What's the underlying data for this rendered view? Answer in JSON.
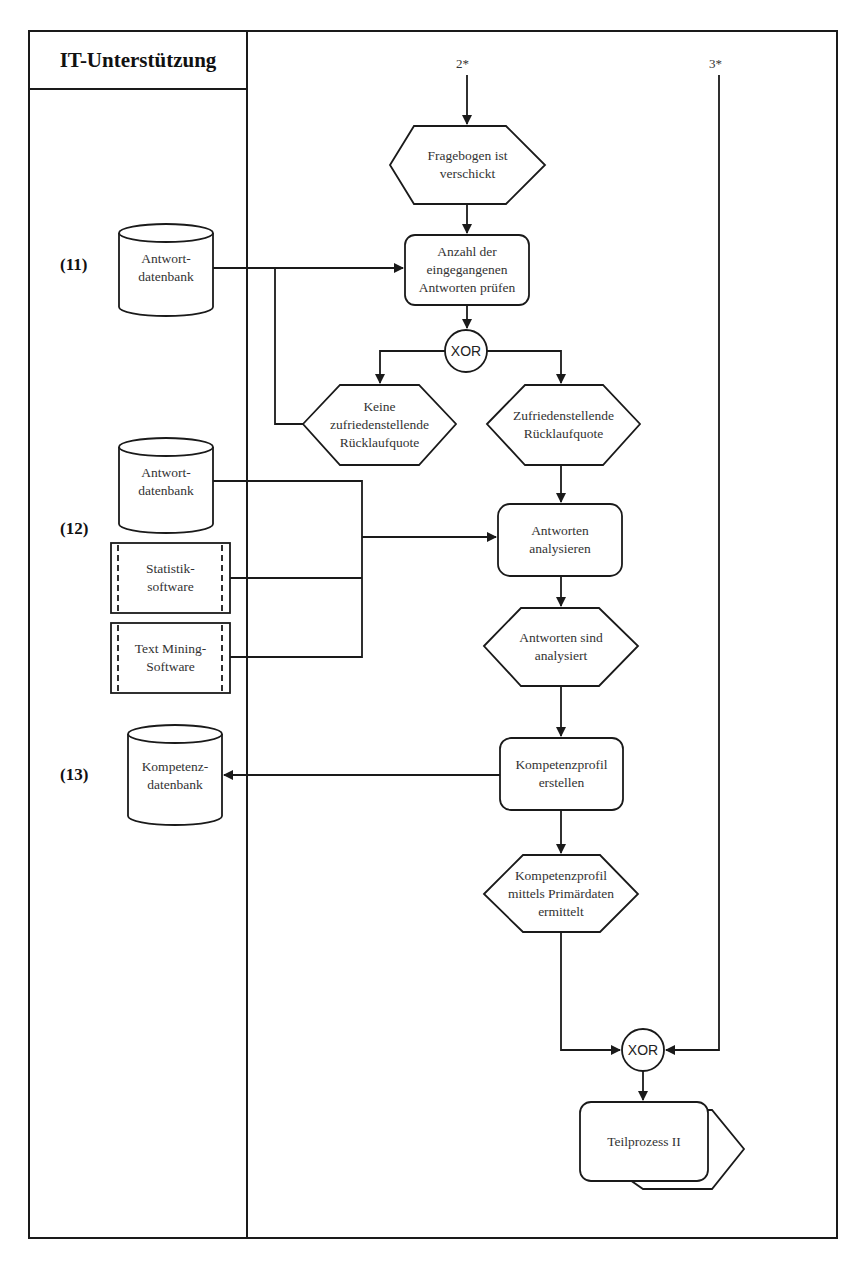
{
  "lane": {
    "title": "IT-Unterstützung"
  },
  "connectors": {
    "top_left": "2*",
    "top_right": "3*"
  },
  "groups": [
    {
      "id": "11",
      "label": "(11)"
    },
    {
      "id": "12",
      "label": "(12)"
    },
    {
      "id": "13",
      "label": "(13)"
    }
  ],
  "systems": {
    "db_11": {
      "line1": "Antwort-",
      "line2": "datenbank"
    },
    "db_12": {
      "line1": "Antwort-",
      "line2": "datenbank"
    },
    "stat_sw": {
      "line1": "Statistik-",
      "line2": "software"
    },
    "tm_sw": {
      "line1": "Text Mining-",
      "line2": "Software"
    },
    "db_13": {
      "line1": "Kompetenz-",
      "line2": "datenbank"
    }
  },
  "events": {
    "e1": {
      "lines": [
        "Fragebogen ist",
        "verschickt"
      ]
    },
    "e2": {
      "lines": [
        "Keine",
        "zufriedenstellende",
        "Rücklaufquote"
      ]
    },
    "e3": {
      "lines": [
        "Zufriedenstellende",
        "Rücklaufquote"
      ]
    },
    "e4": {
      "lines": [
        "Antworten sind",
        "analysiert"
      ]
    },
    "e5": {
      "lines": [
        "Kompetenzprofil",
        "mittels Primärdaten",
        "ermittelt"
      ]
    }
  },
  "functions": {
    "f1": {
      "lines": [
        "Anzahl der",
        "eingegangenen",
        "Antworten prüfen"
      ]
    },
    "f2": {
      "lines": [
        "Antworten",
        "analysieren"
      ]
    },
    "f3": {
      "lines": [
        "Kompetenzprofil",
        "erstellen"
      ]
    }
  },
  "operators": {
    "xor1": "XOR",
    "xor2": "XOR"
  },
  "process_interface": {
    "label": "Teilprozess II"
  },
  "colors": {
    "stroke": "#1a1a1a",
    "background": "#ffffff",
    "text": "#333333"
  }
}
